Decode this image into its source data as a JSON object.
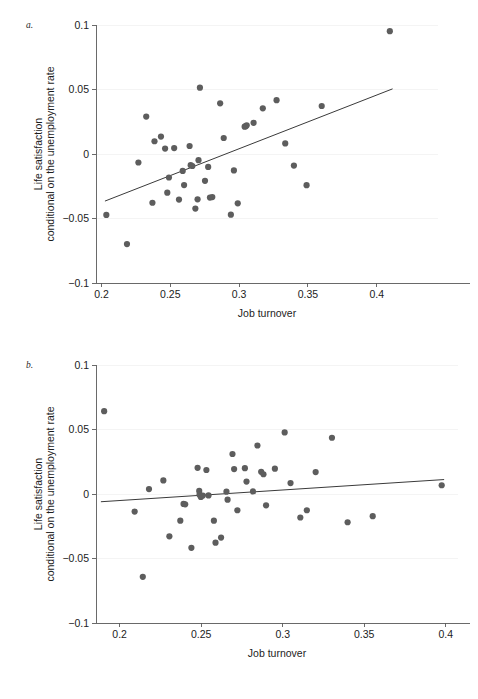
{
  "figure": {
    "background": "#ffffff",
    "point_color": "#5d5d5d",
    "line_color": "#3a3a3a",
    "axis_color": "#5a5a5a"
  },
  "chart_data": [
    {
      "id": "panel-a",
      "type": "scatter",
      "panel_label": "a.",
      "title": "",
      "xlabel": "Job turnover",
      "ylabel_line1": "Life satisfaction",
      "ylabel_line2": "conditional on the unemployment rate",
      "xlim": [
        0.196,
        0.4445
      ],
      "ylim": [
        -0.1,
        0.1
      ],
      "xticks": [
        0.2,
        0.25,
        0.3,
        0.35,
        0.4
      ],
      "xticklabels": [
        "0.2",
        "0.25",
        "0.3",
        "0.35",
        "0.4"
      ],
      "yticks": [
        -0.1,
        -0.05,
        0,
        0.05,
        0.1
      ],
      "yticklabels": [
        "−0.1",
        "−0.05",
        "0",
        "0.05",
        "0.1"
      ],
      "grid": false,
      "legend": "none",
      "points": [
        [
          0.2035,
          -0.0472
        ],
        [
          0.2185,
          -0.0698
        ],
        [
          0.2268,
          -0.0066
        ],
        [
          0.2325,
          0.029
        ],
        [
          0.237,
          -0.0378
        ],
        [
          0.2385,
          0.0099
        ],
        [
          0.2432,
          0.0135
        ],
        [
          0.2462,
          0.0042
        ],
        [
          0.2478,
          -0.03
        ],
        [
          0.249,
          -0.0182
        ],
        [
          0.2528,
          0.0046
        ],
        [
          0.2563,
          -0.0353
        ],
        [
          0.259,
          -0.0131
        ],
        [
          0.26,
          -0.0241
        ],
        [
          0.264,
          0.0062
        ],
        [
          0.2648,
          -0.0087
        ],
        [
          0.266,
          -0.0093
        ],
        [
          0.2682,
          -0.0423
        ],
        [
          0.2698,
          -0.0351
        ],
        [
          0.2705,
          -0.0048
        ],
        [
          0.2715,
          0.0514
        ],
        [
          0.2752,
          -0.0208
        ],
        [
          0.2775,
          -0.01
        ],
        [
          0.2788,
          -0.0338
        ],
        [
          0.2805,
          -0.0334
        ],
        [
          0.2862,
          0.0393
        ],
        [
          0.2888,
          0.0124
        ],
        [
          0.294,
          -0.047
        ],
        [
          0.2962,
          -0.0127
        ],
        [
          0.299,
          -0.0382
        ],
        [
          0.304,
          0.0212
        ],
        [
          0.3048,
          0.0216
        ],
        [
          0.3055,
          0.0223
        ],
        [
          0.3105,
          0.0242
        ],
        [
          0.3172,
          0.0354
        ],
        [
          0.3272,
          0.0417
        ],
        [
          0.3335,
          0.0082
        ],
        [
          0.3398,
          -0.009
        ],
        [
          0.349,
          -0.0242
        ],
        [
          0.36,
          0.0372
        ],
        [
          0.4095,
          0.0952
        ]
      ],
      "fit_line": {
        "x1": 0.2025,
        "y1": -0.0365,
        "x2": 0.4115,
        "y2": 0.0505
      }
    },
    {
      "id": "panel-b",
      "type": "scatter",
      "panel_label": "b.",
      "title": "",
      "xlabel": "Job turnover",
      "ylabel_line1": "Life satisfaction",
      "ylabel_line2": "conditional on the unemployment rate",
      "xlim": [
        0.1855,
        0.4075
      ],
      "ylim": [
        -0.1,
        0.1
      ],
      "xticks": [
        0.2,
        0.25,
        0.3,
        0.35,
        0.4
      ],
      "xticklabels": [
        "0.2",
        "0.25",
        "0.3",
        "0.35",
        "0.4"
      ],
      "yticks": [
        -0.1,
        -0.05,
        0,
        0.05,
        0.1
      ],
      "yticklabels": [
        "−0.1",
        "−0.05",
        "0",
        "0.05",
        "0.1"
      ],
      "grid": false,
      "legend": "none",
      "points": [
        [
          0.1905,
          0.0642
        ],
        [
          0.2092,
          -0.0136
        ],
        [
          0.2142,
          -0.0642
        ],
        [
          0.218,
          0.0038
        ],
        [
          0.2268,
          0.0105
        ],
        [
          0.2305,
          -0.0328
        ],
        [
          0.2372,
          -0.0207
        ],
        [
          0.2392,
          -0.0077
        ],
        [
          0.2402,
          -0.008
        ],
        [
          0.244,
          -0.0417
        ],
        [
          0.2478,
          0.0203
        ],
        [
          0.2488,
          0.0024
        ],
        [
          0.249,
          -0.0005
        ],
        [
          0.2498,
          -0.0023
        ],
        [
          0.251,
          -0.0012
        ],
        [
          0.2532,
          0.0186
        ],
        [
          0.2545,
          -0.0011
        ],
        [
          0.2578,
          -0.0207
        ],
        [
          0.2588,
          -0.0377
        ],
        [
          0.2622,
          -0.0338
        ],
        [
          0.2655,
          0.0018
        ],
        [
          0.2662,
          -0.0044
        ],
        [
          0.2692,
          0.031
        ],
        [
          0.2702,
          0.0193
        ],
        [
          0.2722,
          -0.0126
        ],
        [
          0.2768,
          0.02
        ],
        [
          0.2778,
          0.0096
        ],
        [
          0.2818,
          0.002
        ],
        [
          0.2845,
          0.0376
        ],
        [
          0.2868,
          0.0172
        ],
        [
          0.2882,
          0.0153
        ],
        [
          0.2898,
          -0.0088
        ],
        [
          0.2952,
          0.0196
        ],
        [
          0.3012,
          0.0477
        ],
        [
          0.3048,
          0.0085
        ],
        [
          0.3108,
          -0.0182
        ],
        [
          0.3148,
          -0.0126
        ],
        [
          0.3202,
          0.017
        ],
        [
          0.3302,
          0.0436
        ],
        [
          0.3398,
          -0.0219
        ],
        [
          0.3552,
          -0.0172
        ],
        [
          0.3975,
          0.0068
        ]
      ],
      "fit_line": {
        "x1": 0.1885,
        "y1": -0.006,
        "x2": 0.399,
        "y2": 0.0112
      }
    }
  ]
}
